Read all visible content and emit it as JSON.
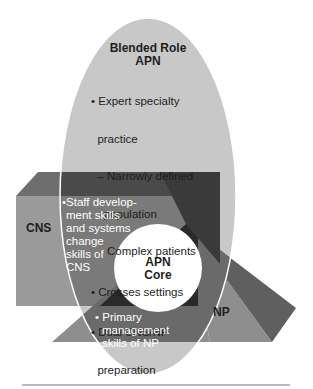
{
  "diagram": {
    "ellipse": {
      "title_line1": "Blended Role",
      "title_line2": "APN",
      "items": [
        {
          "text": "• Expert specialty"
        },
        {
          "text": "  practice"
        },
        {
          "text": "  – Narrowly defined"
        },
        {
          "text": "    population"
        },
        {
          "text": "  – Complex patients"
        },
        {
          "text": "• Crosses settings"
        },
        {
          "text": "• Dual CNS/NP"
        },
        {
          "text": "  preparation"
        }
      ]
    },
    "cns": {
      "label": "CNS",
      "skills_lines": [
        "•Staff develop-",
        "ment skills",
        "and systems",
        "change",
        "skills of",
        "CNS"
      ]
    },
    "core": {
      "line1": "APN",
      "line2": "Core"
    },
    "np": {
      "label": "NP",
      "skills_lines": [
        "• Primary",
        "management",
        "skills of NP"
      ]
    },
    "colors": {
      "ellipse": "#c8c8c8",
      "cns_front": "#9a9a9a",
      "cns_top": "#6e6e6e",
      "pyramid_left": "#3a3a3a",
      "pyramid_right": "#5f5f5f",
      "np_face": "#8e8e8e",
      "overlap_dark": "#2a2a2a",
      "core_circle": "#ffffff",
      "rule": "#777777"
    }
  }
}
